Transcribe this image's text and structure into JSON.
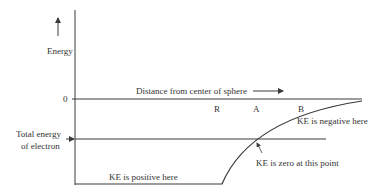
{
  "diagram": {
    "type": "energy-diagram",
    "y_axis_label": "Energy",
    "zero_label": "0",
    "x_axis_label": "Distance from center of sphere",
    "total_energy_label_line1": "Total energy",
    "total_energy_label_line2": "of electron",
    "point_labels": {
      "R": "R",
      "A": "A",
      "B": "B"
    },
    "annotations": {
      "ke_negative": "KE is negative here",
      "ke_zero": "KE is zero at this point",
      "ke_positive": "KE is positive here"
    },
    "colors": {
      "line": "#3a3a3a",
      "text": "#333333",
      "background": "#ffffff"
    }
  }
}
